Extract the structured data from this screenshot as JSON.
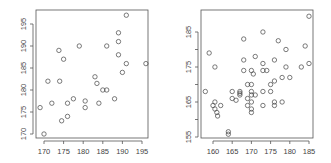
{
  "chart_data": [
    {
      "type": "scatter",
      "title": "",
      "xlabel": "",
      "ylabel": "",
      "xlim": [
        168.5,
        197
      ],
      "ylim": [
        169,
        198
      ],
      "xticks": [
        170,
        175,
        180,
        185,
        190,
        195
      ],
      "yticks": [
        170,
        175,
        180,
        185,
        190,
        195
      ],
      "grid": false,
      "legend": null,
      "points": [
        {
          "x": 169,
          "y": 176
        },
        {
          "x": 170,
          "y": 170
        },
        {
          "x": 171,
          "y": 182
        },
        {
          "x": 172,
          "y": 177
        },
        {
          "x": 173.8,
          "y": 189
        },
        {
          "x": 174,
          "y": 182
        },
        {
          "x": 174.5,
          "y": 173
        },
        {
          "x": 175,
          "y": 187
        },
        {
          "x": 176,
          "y": 177
        },
        {
          "x": 176,
          "y": 174
        },
        {
          "x": 177.5,
          "y": 178
        },
        {
          "x": 179,
          "y": 190
        },
        {
          "x": 180.5,
          "y": 177.5
        },
        {
          "x": 180.5,
          "y": 176
        },
        {
          "x": 183,
          "y": 183
        },
        {
          "x": 183.5,
          "y": 181.5
        },
        {
          "x": 184,
          "y": 177
        },
        {
          "x": 185,
          "y": 180
        },
        {
          "x": 186,
          "y": 180
        },
        {
          "x": 186,
          "y": 190
        },
        {
          "x": 188,
          "y": 178
        },
        {
          "x": 189,
          "y": 193
        },
        {
          "x": 189,
          "y": 191
        },
        {
          "x": 189,
          "y": 188
        },
        {
          "x": 190,
          "y": 184
        },
        {
          "x": 191,
          "y": 186
        },
        {
          "x": 191,
          "y": 197
        },
        {
          "x": 196,
          "y": 186
        }
      ]
    },
    {
      "type": "scatter",
      "title": "",
      "xlabel": "",
      "ylabel": "",
      "xlim": [
        157,
        186
      ],
      "ylim": [
        154,
        190
      ],
      "xticks": [
        160,
        165,
        170,
        175,
        180,
        185
      ],
      "yticks": [
        155,
        160,
        165,
        170,
        175,
        180,
        185
      ],
      "ytick_labels": [
        "155",
        "",
        "165",
        "",
        "175",
        "",
        "185"
      ],
      "grid": false,
      "legend": null,
      "points": [
        {
          "x": 158,
          "y": 168
        },
        {
          "x": 159,
          "y": 179
        },
        {
          "x": 160,
          "y": 164
        },
        {
          "x": 160.5,
          "y": 175
        },
        {
          "x": 160.5,
          "y": 165
        },
        {
          "x": 160.5,
          "y": 163
        },
        {
          "x": 161,
          "y": 162
        },
        {
          "x": 161.2,
          "y": 161
        },
        {
          "x": 162,
          "y": 164
        },
        {
          "x": 164,
          "y": 156.5
        },
        {
          "x": 164,
          "y": 155.8
        },
        {
          "x": 165,
          "y": 168
        },
        {
          "x": 165,
          "y": 166
        },
        {
          "x": 166,
          "y": 165.5
        },
        {
          "x": 167,
          "y": 168
        },
        {
          "x": 167,
          "y": 167.5
        },
        {
          "x": 167,
          "y": 167
        },
        {
          "x": 168,
          "y": 174
        },
        {
          "x": 168,
          "y": 177
        },
        {
          "x": 168,
          "y": 183
        },
        {
          "x": 169,
          "y": 170
        },
        {
          "x": 169,
          "y": 166
        },
        {
          "x": 169,
          "y": 164
        },
        {
          "x": 170,
          "y": 174
        },
        {
          "x": 170,
          "y": 170
        },
        {
          "x": 170,
          "y": 168
        },
        {
          "x": 170,
          "y": 167
        },
        {
          "x": 170,
          "y": 165
        },
        {
          "x": 170,
          "y": 163
        },
        {
          "x": 170,
          "y": 162
        },
        {
          "x": 170.5,
          "y": 173
        },
        {
          "x": 171,
          "y": 167
        },
        {
          "x": 171,
          "y": 178
        },
        {
          "x": 173,
          "y": 185
        },
        {
          "x": 173,
          "y": 176
        },
        {
          "x": 173,
          "y": 174
        },
        {
          "x": 173,
          "y": 168
        },
        {
          "x": 173,
          "y": 164
        },
        {
          "x": 174,
          "y": 174
        },
        {
          "x": 175,
          "y": 170
        },
        {
          "x": 175,
          "y": 168
        },
        {
          "x": 176,
          "y": 177
        },
        {
          "x": 176,
          "y": 171
        },
        {
          "x": 176,
          "y": 165
        },
        {
          "x": 176,
          "y": 164
        },
        {
          "x": 177,
          "y": 182.5
        },
        {
          "x": 178,
          "y": 172
        },
        {
          "x": 178,
          "y": 165
        },
        {
          "x": 179,
          "y": 180
        },
        {
          "x": 179,
          "y": 175
        },
        {
          "x": 180,
          "y": 172
        },
        {
          "x": 183,
          "y": 175
        },
        {
          "x": 184,
          "y": 181
        },
        {
          "x": 185,
          "y": 189.5
        },
        {
          "x": 185,
          "y": 176
        }
      ]
    }
  ]
}
